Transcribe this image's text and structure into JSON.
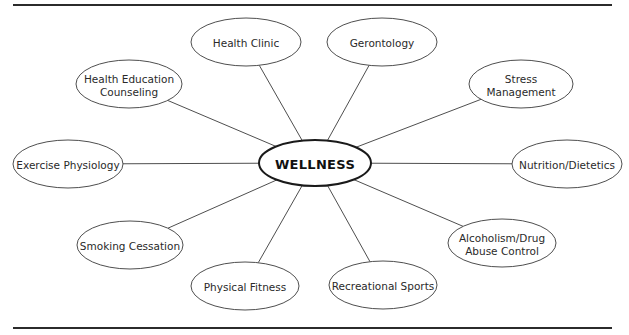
{
  "diagram": {
    "type": "hub-and-spoke",
    "hub": {
      "label": "WELLNESS",
      "cx": 315,
      "cy": 163,
      "rx": 56,
      "ry": 23
    },
    "nodes": [
      {
        "id": "health-clinic",
        "lines": [
          "Health Clinic"
        ],
        "cx": 246,
        "cy": 42,
        "rx": 55,
        "ry": 24
      },
      {
        "id": "gerontology",
        "lines": [
          "Gerontology"
        ],
        "cx": 382,
        "cy": 42,
        "rx": 55,
        "ry": 24
      },
      {
        "id": "health-education-counseling",
        "lines": [
          "Health Education",
          "Counseling"
        ],
        "cx": 129,
        "cy": 84,
        "rx": 53,
        "ry": 24
      },
      {
        "id": "stress-management",
        "lines": [
          "Stress",
          "Management"
        ],
        "cx": 521,
        "cy": 84,
        "rx": 52,
        "ry": 24
      },
      {
        "id": "exercise-physiology",
        "lines": [
          "Exercise Physiology"
        ],
        "cx": 68,
        "cy": 164,
        "rx": 55,
        "ry": 24
      },
      {
        "id": "nutrition-dietetics",
        "lines": [
          "Nutrition/Dietetics"
        ],
        "cx": 567,
        "cy": 164,
        "rx": 55,
        "ry": 24
      },
      {
        "id": "smoking-cessation",
        "lines": [
          "Smoking Cessation"
        ],
        "cx": 130,
        "cy": 245,
        "rx": 53,
        "ry": 24
      },
      {
        "id": "alcoholism-drug-abuse-control",
        "lines": [
          "Alcoholism/Drug",
          "Abuse Control"
        ],
        "cx": 502,
        "cy": 243,
        "rx": 54,
        "ry": 24
      },
      {
        "id": "physical-fitness",
        "lines": [
          "Physical Fitness"
        ],
        "cx": 245,
        "cy": 286,
        "rx": 54,
        "ry": 24
      },
      {
        "id": "recreational-sports",
        "lines": [
          "Recreational Sports"
        ],
        "cx": 383,
        "cy": 285,
        "rx": 54,
        "ry": 24
      }
    ],
    "rules": {
      "top_y": 5,
      "bottom_y": 328,
      "x1": 13,
      "x2": 612
    },
    "colors": {
      "stroke": "#3a3a3a",
      "hub_stroke": "#1a1a1a",
      "text": "#2a2a2a",
      "background": "#ffffff"
    }
  }
}
